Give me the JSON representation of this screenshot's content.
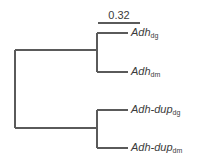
{
  "figure": {
    "type": "phylogenetic-cladogram",
    "background_color": "#ffffff",
    "line_color": "#5a5a5a",
    "text_color": "#3b3b3b"
  },
  "scale_bar": {
    "label": "0.32",
    "x_start": 98,
    "x_end": 140,
    "y": 23
  },
  "tips": [
    {
      "name": "Adh",
      "subscript": "dg",
      "branch_x_start": 97,
      "branch_x_end": 128,
      "branch_y": 33,
      "label_x": 131,
      "label_y": 28
    },
    {
      "name": "Adh",
      "subscript": "dm",
      "branch_x_start": 97,
      "branch_x_end": 128,
      "branch_y": 72,
      "label_x": 131,
      "label_y": 66
    },
    {
      "name": "Adh-dup",
      "subscript": "dg",
      "branch_x_start": 97,
      "branch_x_end": 128,
      "branch_y": 110,
      "label_x": 131,
      "label_y": 104
    },
    {
      "name": "Adh-dup",
      "subscript": "dm",
      "branch_x_start": 97,
      "branch_x_end": 128,
      "branch_y": 148,
      "label_x": 131,
      "label_y": 142
    }
  ],
  "nodes": {
    "root": {
      "x": 15,
      "y_top": 50,
      "y_bottom": 128
    },
    "upper_clade": {
      "x": 97,
      "y_top": 33,
      "y_bottom": 72,
      "stem_y": 50,
      "stem_x_start": 15
    },
    "lower_clade": {
      "x": 97,
      "y_top": 110,
      "y_bottom": 148,
      "stem_y": 128,
      "stem_x_start": 15
    }
  }
}
